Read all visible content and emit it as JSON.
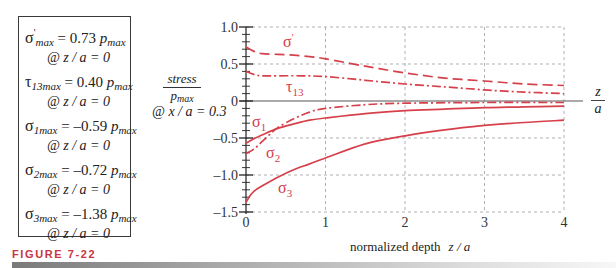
{
  "summary_box": {
    "entries": [
      {
        "symbol": "σ",
        "sup": "'",
        "sub": "max",
        "equals": " = 0.73 ",
        "unit": "p",
        "unit_sub": "max",
        "location": "@ z / a = 0"
      },
      {
        "symbol": "τ",
        "sup": "",
        "sub": "13max",
        "equals": " = 0.40 ",
        "unit": "p",
        "unit_sub": "max",
        "location": "@ z / a = 0"
      },
      {
        "symbol": "σ",
        "sup": "",
        "sub": "1max",
        "equals": " = –0.59 ",
        "unit": "p",
        "unit_sub": "max",
        "location": "@ z / a = 0"
      },
      {
        "symbol": "σ",
        "sup": "",
        "sub": "2max",
        "equals": " = –0.72 ",
        "unit": "p",
        "unit_sub": "max",
        "location": "@ z / a = 0"
      },
      {
        "symbol": "σ",
        "sup": "",
        "sub": "3max",
        "equals": " = –1.38 ",
        "unit": "p",
        "unit_sub": "max",
        "location": "@ z / a = 0"
      }
    ]
  },
  "figure_label": "FIGURE 7-22",
  "colors": {
    "curve": "#d6404a",
    "figure_label": "#c9343e",
    "grid": "#a8a8a8",
    "zero_line": "#8c8c8c"
  },
  "chart_data": {
    "type": "line",
    "title": "",
    "ylabel": {
      "numerator": "stress",
      "denominator": "p",
      "denominator_sub": "max"
    },
    "annotation": "@ x / a = 0.3",
    "xlabel": {
      "text": "normalized depth",
      "variable": "z / a"
    },
    "x_axis_end_label": {
      "numerator": "z",
      "denominator": "a"
    },
    "xlim": [
      0,
      4
    ],
    "ylim": [
      -1.5,
      1.0
    ],
    "xticks": [
      0,
      1,
      2,
      3,
      4
    ],
    "xtick_labels": [
      "0",
      "1",
      "2",
      "3",
      "4"
    ],
    "yticks": [
      1.0,
      0.5,
      0,
      -0.5,
      -1.0,
      -1.5
    ],
    "ytick_labels": [
      "1.0",
      "0.5",
      "0",
      "–0.5",
      "–1.0",
      "–1.5"
    ],
    "y_minor_step": 0.1,
    "grid": true,
    "series": [
      {
        "id": "sigma-prime",
        "label_symbol": "σ",
        "label_sup": "'",
        "label_sub": "",
        "line_style": "dashed",
        "x": [
          0,
          0.1,
          0.2,
          0.4,
          0.6,
          0.8,
          1.0,
          1.5,
          2.0,
          2.5,
          3.0,
          3.5,
          4.0
        ],
        "y": [
          0.73,
          0.67,
          0.64,
          0.63,
          0.62,
          0.6,
          0.57,
          0.47,
          0.38,
          0.31,
          0.27,
          0.23,
          0.21
        ]
      },
      {
        "id": "tau13",
        "label_symbol": "τ",
        "label_sup": "",
        "label_sub": "13",
        "line_style": "dash-dot",
        "x": [
          0,
          0.1,
          0.2,
          0.4,
          0.7,
          1.0,
          1.5,
          2.0,
          2.5,
          3.0,
          3.5,
          4.0
        ],
        "y": [
          0.4,
          0.36,
          0.34,
          0.34,
          0.34,
          0.33,
          0.28,
          0.23,
          0.19,
          0.15,
          0.12,
          0.1
        ]
      },
      {
        "id": "sigma1",
        "label_symbol": "σ",
        "label_sup": "",
        "label_sub": "1",
        "line_style": "solid",
        "x": [
          0,
          0.1,
          0.2,
          0.4,
          0.6,
          0.8,
          1.0,
          1.5,
          2.0,
          2.5,
          3.0,
          3.5,
          4.0
        ],
        "y": [
          -0.57,
          -0.51,
          -0.46,
          -0.37,
          -0.31,
          -0.26,
          -0.23,
          -0.17,
          -0.13,
          -0.11,
          -0.09,
          -0.08,
          -0.07
        ]
      },
      {
        "id": "sigma2",
        "label_symbol": "σ",
        "label_sup": "",
        "label_sub": "2",
        "line_style": "dash-dot",
        "x": [
          0,
          0.1,
          0.2,
          0.3,
          0.4,
          0.6,
          0.8,
          1.0,
          1.5,
          2.0,
          3.0,
          4.0
        ],
        "y": [
          -0.71,
          -0.65,
          -0.55,
          -0.45,
          -0.36,
          -0.24,
          -0.15,
          -0.1,
          -0.05,
          -0.03,
          -0.02,
          -0.02
        ]
      },
      {
        "id": "sigma3",
        "label_symbol": "σ",
        "label_sup": "",
        "label_sub": "3",
        "line_style": "solid",
        "x": [
          0,
          0.05,
          0.1,
          0.2,
          0.4,
          0.6,
          0.8,
          1.0,
          1.5,
          2.0,
          2.5,
          3.0,
          3.5,
          4.0
        ],
        "y": [
          -1.37,
          -1.28,
          -1.22,
          -1.15,
          -1.03,
          -0.93,
          -0.85,
          -0.77,
          -0.58,
          -0.47,
          -0.39,
          -0.33,
          -0.29,
          -0.26
        ]
      }
    ]
  }
}
